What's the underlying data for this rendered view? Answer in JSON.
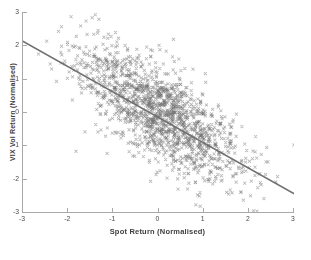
{
  "figure": {
    "background": "#ffffff",
    "axis_color": "#a9a9a9",
    "text_color": "#3d3d3d"
  },
  "chart_data": {
    "type": "scatter",
    "title": "",
    "xlabel": "Spot Return (Normalised)",
    "ylabel": "VIX Vol Return (Normalised)",
    "xlim": [
      -3,
      3
    ],
    "ylim": [
      -3,
      3
    ],
    "xticks": [
      -3,
      -2,
      -1,
      0,
      1,
      2,
      3
    ],
    "yticks": [
      -3,
      -2,
      -1,
      0,
      1,
      2,
      3
    ],
    "grid": false,
    "legend": null,
    "marker": {
      "shape": "x",
      "color": "#6e6e6e",
      "opacity": 0.5,
      "size": 2.6,
      "stroke_width": 0.8
    },
    "trendline": {
      "x1": -3,
      "y1": 2.12,
      "x2": 3,
      "y2": -2.45,
      "color": "#6f6f6f",
      "width": 1.5
    },
    "cloud": {
      "description": "dense bivariate-normal point cloud of x-markers, strong negative correlation between spot return and VIX vol return",
      "n": 1600,
      "mean": [
        0.02,
        -0.05
      ],
      "std": [
        0.92,
        1.02
      ],
      "corr": -0.72,
      "seed": 20240605
    }
  }
}
